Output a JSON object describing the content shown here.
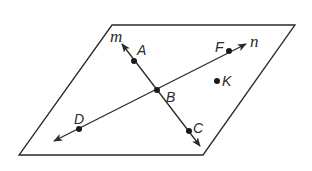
{
  "diagram": {
    "type": "geometry-plane-with-lines",
    "colors": {
      "stroke": "#2a2a2a",
      "background": "#ffffff"
    },
    "plane": {
      "shape": "parallelogram",
      "vertices": [
        [
          112,
          25
        ],
        [
          295,
          25
        ],
        [
          203,
          155
        ],
        [
          19,
          155
        ]
      ]
    },
    "lines": [
      {
        "name": "m",
        "label": "m",
        "from": [
          200,
          146
        ],
        "to": [
          122,
          44
        ],
        "arrows": "both",
        "label_pos": [
          110,
          42
        ]
      },
      {
        "name": "n",
        "label": "n",
        "from": [
          54,
          141
        ],
        "to": [
          246,
          44
        ],
        "arrows": "both",
        "label_pos": [
          250,
          47
        ]
      }
    ],
    "points": [
      {
        "label": "A",
        "pos": [
          134,
          61
        ],
        "label_pos": [
          137,
          55
        ]
      },
      {
        "label": "B",
        "pos": [
          157,
          90
        ],
        "label_pos": [
          166,
          102
        ]
      },
      {
        "label": "C",
        "pos": [
          189,
          131
        ],
        "label_pos": [
          193,
          133
        ]
      },
      {
        "label": "D",
        "pos": [
          79,
          129
        ],
        "label_pos": [
          74,
          124
        ]
      },
      {
        "label": "F",
        "pos": [
          229,
          51
        ],
        "label_pos": [
          215,
          52
        ]
      },
      {
        "label": "K",
        "pos": [
          217,
          81
        ],
        "label_pos": [
          222,
          86
        ]
      }
    ]
  }
}
